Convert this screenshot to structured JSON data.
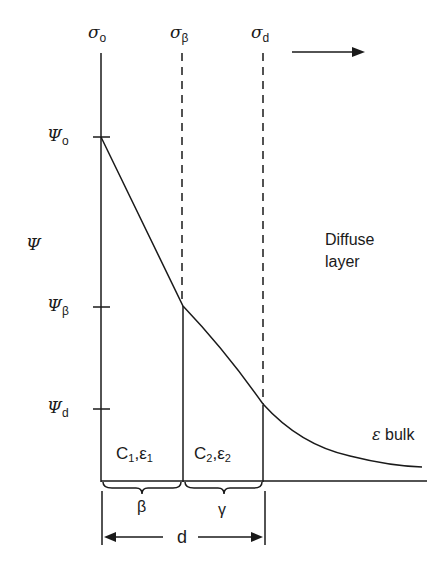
{
  "diagram": {
    "top_labels": [
      {
        "symbol": "σ",
        "sub": "o"
      },
      {
        "symbol": "σ",
        "sub": "β"
      },
      {
        "symbol": "σ",
        "sub": "d"
      }
    ],
    "axis_label": "Ψ",
    "potential_labels": [
      {
        "symbol": "Ψ",
        "sub": "o"
      },
      {
        "symbol": "Ψ",
        "sub": "β"
      },
      {
        "symbol": "Ψ",
        "sub": "d"
      }
    ],
    "region_labels": [
      {
        "c": "C",
        "c_sub": "1",
        "e": "ε",
        "e_sub": "1"
      },
      {
        "c": "C",
        "c_sub": "2",
        "e": "ε",
        "e_sub": "2"
      }
    ],
    "brace_labels": [
      "β",
      "γ"
    ],
    "distance_label": "d",
    "diffuse_label_line1": "Diffuse",
    "diffuse_label_line2": "layer",
    "bulk_label_symbol": "ε",
    "bulk_label_text": "bulk"
  }
}
